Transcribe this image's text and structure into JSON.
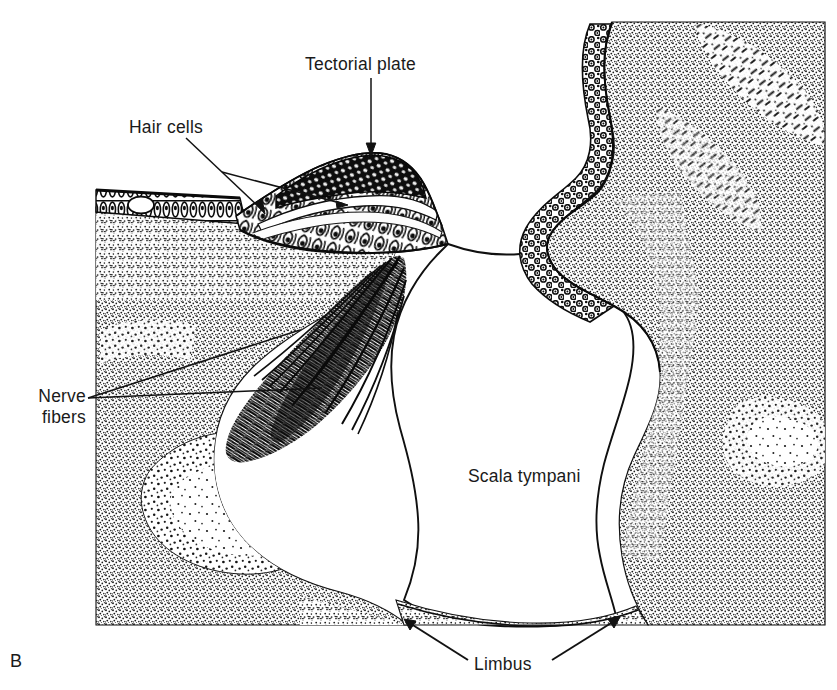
{
  "figure": {
    "panel_letter": "B",
    "ink_color": "#111111",
    "background_color": "#ffffff",
    "label_color": "#1a1a1a"
  },
  "labels": {
    "tectorial_plate": "Tectorial plate",
    "hair_cells": "Hair cells",
    "nerve_fibers_line1": "Nerve",
    "nerve_fibers_line2": "fibers",
    "scala_tympani": "Scala tympani",
    "limbus": "Limbus"
  },
  "structures": [
    {
      "name": "organ-of-corti",
      "label": "Hair cells"
    },
    {
      "name": "tectorial-plate",
      "label": "Tectorial plate"
    },
    {
      "name": "nerve-fiber-bundle",
      "label": "Nerve fibers"
    },
    {
      "name": "scala-tympani-cavity",
      "label": "Scala tympani"
    },
    {
      "name": "limbus-tissue",
      "label": "Limbus"
    },
    {
      "name": "spiral-ligament-mass",
      "label": ""
    },
    {
      "name": "spiral-ganglion-region",
      "label": ""
    }
  ]
}
